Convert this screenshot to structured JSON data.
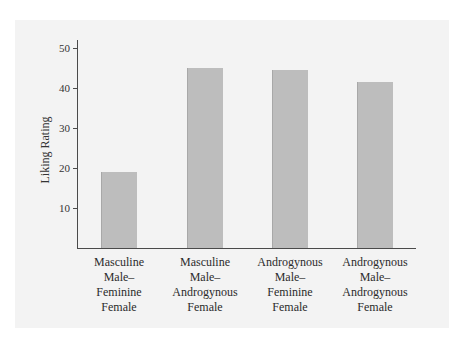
{
  "chart_data": {
    "type": "bar",
    "title": "",
    "xlabel": "",
    "ylabel": "Liking Rating",
    "ylim": [
      0,
      50
    ],
    "yticks": [
      10,
      20,
      30,
      40,
      50
    ],
    "grid": false,
    "legend": null,
    "categories": [
      "Masculine Male–Feminine Female",
      "Masculine Male–Androgynous Female",
      "Androgynous Male–Feminine Female",
      "Androgynous Male–Androgynous Female"
    ],
    "category_lines": [
      [
        "Masculine",
        "Male–",
        "Feminine",
        "Female"
      ],
      [
        "Masculine",
        "Male–",
        "Androgynous",
        "Female"
      ],
      [
        "Androgynous",
        "Male–",
        "Feminine",
        "Female"
      ],
      [
        "Androgynous",
        "Male–",
        "Androgynous",
        "Female"
      ]
    ],
    "values": [
      19,
      45,
      44.5,
      41.5
    ],
    "bar_color": "#bdbdbd",
    "background_color": "#f3f3f3"
  },
  "axis": {
    "y_label": "Liking Rating",
    "ticks": [
      "10",
      "20",
      "30",
      "40",
      "50"
    ]
  }
}
